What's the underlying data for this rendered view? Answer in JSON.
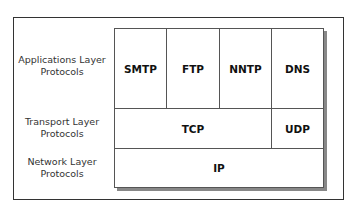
{
  "diagram": {
    "layers": [
      {
        "label_line1": "Applications Layer",
        "label_line2": "Protocols",
        "protocols": [
          "SMTP",
          "FTP",
          "NNTP",
          "DNS"
        ]
      },
      {
        "label_line1": "Transport Layer",
        "label_line2": "Protocols",
        "protocols": [
          "TCP",
          "UDP"
        ]
      },
      {
        "label_line1": "Network Layer",
        "label_line2": "Protocols",
        "protocols": [
          "IP"
        ]
      }
    ]
  }
}
